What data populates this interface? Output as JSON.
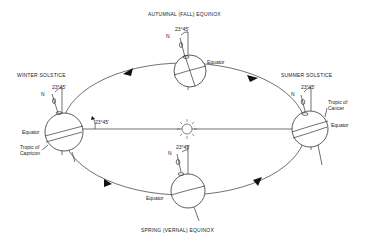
{
  "diagram": {
    "type": "earth-orbit-seasons",
    "sun": {
      "icon": "sun-icon"
    },
    "positions": [
      {
        "id": "autumnal",
        "title": "AUTUMNAL  (FALL) EQUINOX",
        "tilt_label": "23°45'",
        "north_label": "N",
        "labels": [
          "Equator"
        ]
      },
      {
        "id": "winter",
        "title": "WINTER  SOLSTICE",
        "tilt_label": "23°45'",
        "north_label": "N",
        "orbit_angle_label": "23°45'",
        "labels": [
          "Equator",
          "Tropic of",
          "Capricon"
        ]
      },
      {
        "id": "summer",
        "title": "SUMMER  SOLSTICE",
        "tilt_label": "23°45'",
        "north_label": "N",
        "labels": [
          "Tropic of",
          "Cancer",
          "Equator"
        ]
      },
      {
        "id": "spring",
        "title": "SPRING  (VERNAL)  EQUINOX",
        "tilt_label": "23°45'",
        "north_label": "N",
        "labels": [
          "Equator"
        ]
      }
    ],
    "colors": {
      "line": "#333333",
      "arrow": "#111111",
      "background": "#ffffff"
    }
  }
}
